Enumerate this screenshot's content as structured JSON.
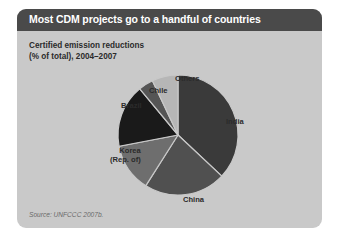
{
  "header": {
    "title": "Most CDM projects go to a handful of countries"
  },
  "subtitle": {
    "line1": "Certified emission reductions",
    "line2": "(% of total), 2004–2007"
  },
  "source": "Source: UNFCCC 2007b.",
  "labels": {
    "india": "India",
    "china": "China",
    "korea_line1": "Korea",
    "korea_line2": "(Rep. of)",
    "brazil": "Brazil",
    "chile": "Chile",
    "others": "Others"
  },
  "colors": {
    "card_background": "#c9c9c9",
    "header_bar": "#4a4a4a",
    "page_background": "#ffffff",
    "india": "#3a3a3a",
    "china": "#505050",
    "korea": "#6e6e6e",
    "brazil": "#1a1a1a",
    "chile": "#555555",
    "others": "#b6b6b6"
  },
  "chart_data": {
    "type": "pie",
    "title": "Most CDM projects go to a handful of countries",
    "subtitle": "Certified emission reductions (% of total), 2004–2007",
    "xlabel": "",
    "ylabel": "",
    "unit": "% of total",
    "legend_position": "none-labels-outside",
    "grid": false,
    "start_angle_deg": 0,
    "direction": "clockwise",
    "categories": [
      "India",
      "China",
      "Korea (Rep. of)",
      "Brazil",
      "Chile",
      "Others"
    ],
    "values": [
      37,
      22,
      13,
      17,
      4,
      7
    ],
    "slices": [
      {
        "label": "India",
        "value": 37,
        "color": "#3a3a3a"
      },
      {
        "label": "China",
        "value": 22,
        "color": "#505050"
      },
      {
        "label": "Korea (Rep. of)",
        "value": 13,
        "color": "#6e6e6e"
      },
      {
        "label": "Brazil",
        "value": 17,
        "color": "#1a1a1a"
      },
      {
        "label": "Chile",
        "value": 4,
        "color": "#555555"
      },
      {
        "label": "Others",
        "value": 7,
        "color": "#b6b6b6"
      }
    ],
    "source": "Source: UNFCCC 2007b."
  }
}
